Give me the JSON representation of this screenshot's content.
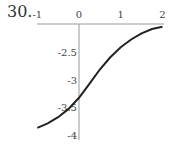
{
  "problem_number": "30.",
  "chart_data": {
    "type": "line",
    "title": "",
    "xlabel": "",
    "ylabel": "",
    "xlim": [
      -1,
      2
    ],
    "ylim": [
      -4,
      -2
    ],
    "x_ticks": [
      "-1",
      "0",
      "1",
      "2"
    ],
    "y_ticks": [
      "-2.5",
      "-3",
      "-3.5",
      "-4"
    ],
    "x_axis_position": "top (y = -2)",
    "y_axis_position": "x = 0",
    "grid": false,
    "series": [
      {
        "name": "curve",
        "color": "#222222",
        "x": [
          -1,
          -0.75,
          -0.5,
          -0.25,
          0,
          0.25,
          0.5,
          0.75,
          1,
          1.25,
          1.5,
          1.75,
          2
        ],
        "y": [
          -3.87,
          -3.79,
          -3.68,
          -3.53,
          -3.33,
          -3.08,
          -2.82,
          -2.6,
          -2.42,
          -2.28,
          -2.17,
          -2.09,
          -2.05
        ]
      }
    ]
  }
}
